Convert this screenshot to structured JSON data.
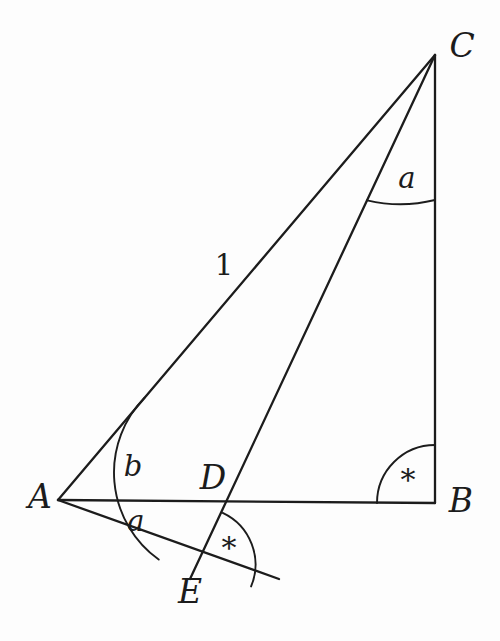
{
  "figure": {
    "kind": "geometry-diagram",
    "caption": "",
    "background_color": "#fdfdfd",
    "stroke_color": "#1c1c1c",
    "canvas": {
      "width": 500,
      "height": 641
    }
  },
  "points": [
    {
      "id": "A",
      "label": "A",
      "x": 58,
      "y": 500,
      "label_x": 40,
      "label_y": 496
    },
    {
      "id": "B",
      "label": "B",
      "x": 435,
      "y": 503,
      "label_x": 461,
      "label_y": 500
    },
    {
      "id": "C",
      "label": "C",
      "x": 435,
      "y": 55,
      "label_x": 462,
      "label_y": 45
    },
    {
      "id": "D",
      "label": "D",
      "x": 228,
      "y": 503,
      "label_x": 213,
      "label_y": 477
    },
    {
      "id": "E",
      "label": "E",
      "x": 197,
      "y": 566,
      "label_x": 190,
      "label_y": 591
    }
  ],
  "segments": [
    {
      "id": "AC",
      "from": "A",
      "to": "C",
      "x1": 58,
      "y1": 500,
      "x2": 435,
      "y2": 55
    },
    {
      "id": "AB",
      "from": "A",
      "to": "B",
      "x1": 58,
      "y1": 500,
      "x2": 435,
      "y2": 503
    },
    {
      "id": "CB",
      "from": "C",
      "to": "B",
      "x1": 435,
      "y1": 55,
      "x2": 435,
      "y2": 503
    },
    {
      "id": "CE",
      "from": "C",
      "to": "E",
      "x1": 435,
      "y1": 55,
      "x2": 190,
      "y2": 579
    },
    {
      "id": "AEX",
      "from": "A",
      "to": "E-extended",
      "x1": 58,
      "y1": 500,
      "x2": 279,
      "y2": 579
    }
  ],
  "angle_marks": [
    {
      "id": "angle-A-upper",
      "at": "A",
      "label": "b",
      "label_x": 133,
      "label_y": 466
    },
    {
      "id": "angle-A-lower",
      "at": "A",
      "label": "a",
      "label_x": 136,
      "label_y": 521
    },
    {
      "id": "angle-C",
      "at": "C",
      "label": "a",
      "label_x": 407,
      "label_y": 178
    },
    {
      "id": "angle-B",
      "at": "B",
      "label": "*",
      "label_x": 408,
      "label_y": 480
    },
    {
      "id": "angle-E",
      "at": "E",
      "label": "*",
      "label_x": 229,
      "label_y": 548
    }
  ],
  "length_labels": [
    {
      "id": "len-AC",
      "text": "1",
      "on_segment": "AC",
      "x": 224,
      "y": 265
    }
  ]
}
